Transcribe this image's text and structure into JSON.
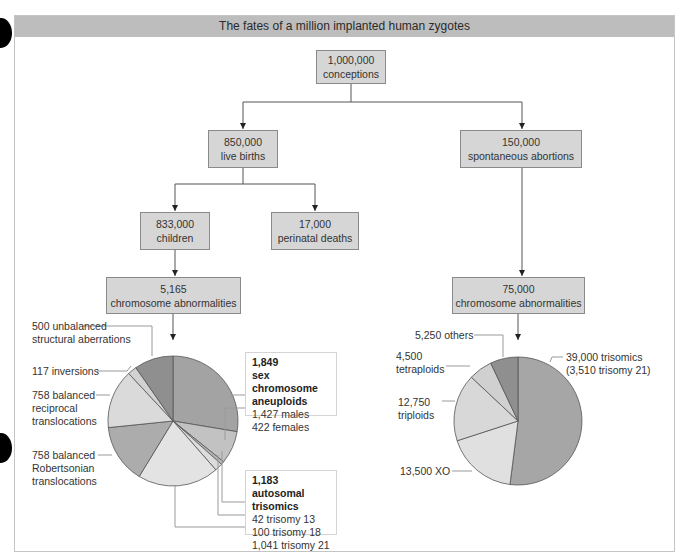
{
  "title": "The fates of a million implanted human zygotes",
  "nodes": {
    "conceptions": {
      "value": "1,000,000",
      "label": "conceptions"
    },
    "live_births": {
      "value": "850,000",
      "label": "live births"
    },
    "spontaneous_abortions": {
      "value": "150,000",
      "label": "spontaneous abortions"
    },
    "children": {
      "value": "833,000",
      "label": "children"
    },
    "perinatal_deaths": {
      "value": "17,000",
      "label": "perinatal deaths"
    },
    "children_abnormalities": {
      "value": "5,165",
      "label": "chromosome abnormalities"
    },
    "abortion_abnormalities": {
      "value": "75,000",
      "label": "chromosome abnormalities"
    }
  },
  "left_labels": {
    "unbalanced_1": "500 unbalanced",
    "unbalanced_2": "structural aberrations",
    "inversions": "117 inversions",
    "reciprocal_1": "758 balanced",
    "reciprocal_2": "reciprocal",
    "reciprocal_3": "translocations",
    "robertsonian_1": "758 balanced",
    "robertsonian_2": "Robertsonian",
    "robertsonian_3": "translocations",
    "sex_title_1": "1,849",
    "sex_title_2": "sex chromosome",
    "sex_title_3": "aneuploids",
    "males": "1,427 males",
    "females": "422 females",
    "auto_title_1": "1,183 autosomal",
    "auto_title_2": "trisomics",
    "t13": "42 trisomy 13",
    "t18": "100 trisomy 18",
    "t21": "1,041 trisomy 21"
  },
  "right_labels": {
    "others": "5,250 others",
    "tetraploids_1": "4,500",
    "tetraploids_2": "tetraploids",
    "triploids_1": "12,750",
    "triploids_2": "triploids",
    "xo": "13,500 XO",
    "trisomics_1": "39,000 trisomics",
    "trisomics_2": "(3,510 trisomy 21)"
  },
  "colors": {
    "title_bar": "#bdbdbd",
    "node_fill": "#d6d6d6",
    "node_border": "#8a8a8a",
    "line": "#555555"
  },
  "chart_data": [
    {
      "type": "pie",
      "title": "5,165 chromosome abnormalities (children)",
      "start_angle_deg": 0,
      "direction": "clockwise",
      "slices": [
        {
          "label": "1,427 males",
          "value": 1427,
          "color": "#a3a3a3"
        },
        {
          "label": "422 females",
          "value": 422,
          "color": "#c2c2c2"
        },
        {
          "label": "42 trisomy 13",
          "value": 42,
          "color": "#b8b8b8"
        },
        {
          "label": "100 trisomy 18",
          "value": 100,
          "color": "#dcdcdc"
        },
        {
          "label": "1,041 trisomy 21",
          "value": 1041,
          "color": "#e3e3e3"
        },
        {
          "label": "758 balanced Robertsonian translocations",
          "value": 758,
          "color": "#acacac"
        },
        {
          "label": "758 balanced reciprocal translocations",
          "value": 758,
          "color": "#dadada"
        },
        {
          "label": "117 inversions",
          "value": 117,
          "color": "#d2d2d2"
        },
        {
          "label": "500 unbalanced structural aberrations",
          "value": 500,
          "color": "#8f8f8f"
        }
      ],
      "groups": [
        {
          "label": "1,849 sex chromosome aneuploids",
          "members": [
            "1,427 males",
            "422 females"
          ]
        },
        {
          "label": "1,183 autosomal trisomics",
          "members": [
            "42 trisomy 13",
            "100 trisomy 18",
            "1,041 trisomy 21"
          ]
        }
      ]
    },
    {
      "type": "pie",
      "title": "75,000 chromosome abnormalities (spontaneous abortions)",
      "start_angle_deg": 0,
      "direction": "clockwise",
      "slices": [
        {
          "label": "39,000 trisomics (3,510 trisomy 21)",
          "value": 39000,
          "color": "#a6a6a6"
        },
        {
          "label": "13,500 XO",
          "value": 13500,
          "color": "#e0e0e0"
        },
        {
          "label": "12,750 triploids",
          "value": 12750,
          "color": "#d8d8d8"
        },
        {
          "label": "4,500 tetraploids",
          "value": 4500,
          "color": "#d0d0d0"
        },
        {
          "label": "5,250 others",
          "value": 5250,
          "color": "#8f8f8f"
        }
      ]
    }
  ]
}
